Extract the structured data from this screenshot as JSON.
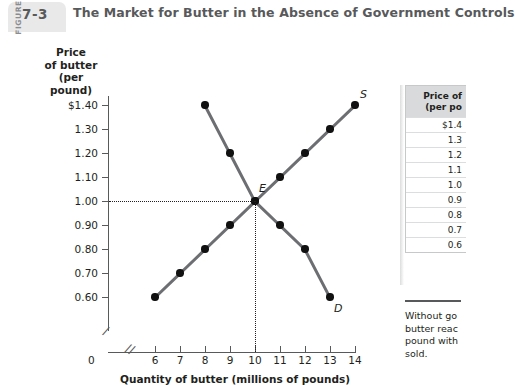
{
  "header": {
    "figure_word": "FIGURE",
    "figure_number": "7-3",
    "title": "The Market for Butter in the Absence of Government Controls"
  },
  "chart_data": {
    "type": "line",
    "title": "The Market for Butter in the Absence of Government Controls",
    "xlabel": "Quantity of butter (millions of pounds)",
    "ylabel": "Price of butter (per pound)",
    "ylabel_lines": [
      "Price",
      "of butter",
      "(per pound)"
    ],
    "origin_label": "0",
    "xlim": [
      6,
      14
    ],
    "ylim": [
      0.6,
      1.4
    ],
    "x_ticks": [
      6,
      7,
      8,
      9,
      10,
      11,
      12,
      13,
      14
    ],
    "x_tick_labels": [
      "6",
      "7",
      "8",
      "9",
      "10",
      "11",
      "12",
      "13",
      "14"
    ],
    "y_ticks": [
      1.4,
      1.3,
      1.2,
      1.1,
      1.0,
      0.9,
      0.8,
      0.7,
      0.6
    ],
    "y_tick_labels": [
      "$1.40",
      "1.30",
      "1.20",
      "1.10",
      "1.00",
      "0.90",
      "0.80",
      "0.70",
      "0.60"
    ],
    "axis_break_x": true,
    "axis_break_y": true,
    "grid": false,
    "legend": "none",
    "series": [
      {
        "name": "Supply",
        "label": "S",
        "x": [
          6,
          7,
          8,
          9,
          10,
          11,
          12,
          13,
          14
        ],
        "y": [
          0.6,
          0.7,
          0.8,
          0.9,
          1.0,
          1.1,
          1.2,
          1.3,
          1.4
        ]
      },
      {
        "name": "Demand",
        "label": "D",
        "x": [
          8,
          9,
          10,
          11,
          12,
          13
        ],
        "y": [
          1.4,
          1.2,
          1.0,
          0.9,
          0.8,
          0.6
        ]
      }
    ],
    "annotations": [
      {
        "label": "E",
        "x": 10,
        "y": 1.0,
        "note": "equilibrium"
      }
    ],
    "guides": {
      "price": 1.0,
      "quantity": 10
    }
  },
  "table": {
    "header_lines": [
      "Price of",
      "(per po"
    ],
    "rows": [
      "$1.4",
      "1.3",
      "1.2",
      "1.1",
      "1.0",
      "0.9",
      "0.8",
      "0.7",
      "0.6"
    ]
  },
  "note": {
    "lines": [
      "Without go",
      "butter reac",
      "pound with",
      "sold."
    ]
  },
  "colors": {
    "curve": "#6d6e71",
    "point": "#111111",
    "axis": "#58595b",
    "tab": "#e9e9ea",
    "table_header": "#d9dadb"
  }
}
